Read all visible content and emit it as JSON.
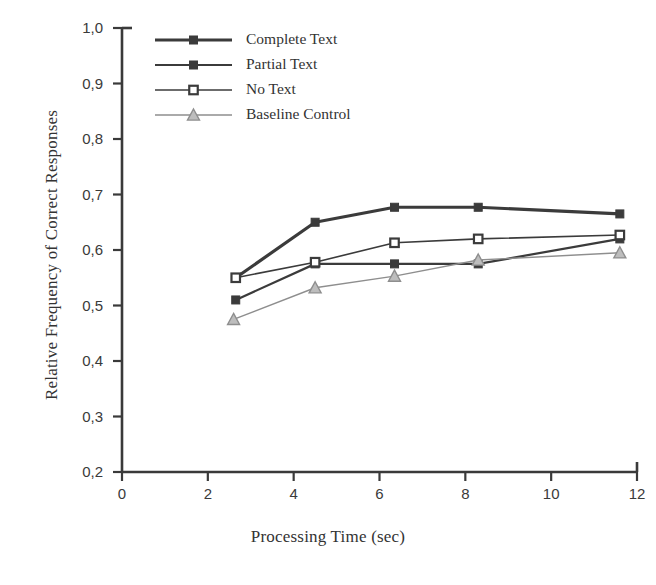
{
  "chart_data": {
    "type": "line",
    "title": "",
    "xlabel": "Processing Time (sec)",
    "ylabel": "Relative Frequency of Correct Responses",
    "xlim": [
      0,
      12
    ],
    "ylim": [
      0.2,
      1.0
    ],
    "xticks": [
      0,
      2,
      4,
      6,
      8,
      10,
      12
    ],
    "xtick_labels": [
      "0",
      "2",
      "4",
      "6",
      "8",
      "10",
      "12"
    ],
    "yticks": [
      0.2,
      0.3,
      0.4,
      0.5,
      0.6,
      0.7,
      0.8,
      0.9,
      1.0
    ],
    "ytick_labels": [
      "0,2",
      "0,3",
      "0,4",
      "0,5",
      "0,6",
      "0,7",
      "0,8",
      "0,9",
      "1,0"
    ],
    "grid": false,
    "legend_position": "upper-left-inside",
    "series": [
      {
        "name": "Complete Text",
        "marker": "filled-square",
        "color": "#3b3b3b",
        "line_width": 3.2,
        "x": [
          2.65,
          4.5,
          6.35,
          8.3,
          11.6
        ],
        "y": [
          0.55,
          0.65,
          0.677,
          0.677,
          0.665
        ]
      },
      {
        "name": "Partial Text",
        "marker": "filled-square",
        "color": "#3b3b3b",
        "line_width": 2.2,
        "x": [
          2.65,
          4.5,
          6.35,
          8.3,
          11.6
        ],
        "y": [
          0.51,
          0.575,
          0.575,
          0.575,
          0.62
        ]
      },
      {
        "name": "No Text",
        "marker": "open-square",
        "color": "#3b3b3b",
        "line_width": 1.6,
        "x": [
          2.65,
          4.5,
          6.35,
          8.3,
          11.6
        ],
        "y": [
          0.55,
          0.578,
          0.613,
          0.62,
          0.627
        ]
      },
      {
        "name": "Baseline Control",
        "marker": "triangle",
        "color": "#8e8e8e",
        "line_width": 1.4,
        "x": [
          2.6,
          4.5,
          6.35,
          8.3,
          11.6
        ],
        "y": [
          0.475,
          0.532,
          0.553,
          0.582,
          0.595
        ]
      }
    ]
  },
  "axes": {
    "y_axis_label": "Relative Frequency of Correct Responses",
    "x_axis_label": "Processing Time (sec)"
  },
  "legend": {
    "entries": [
      {
        "label": "Complete Text"
      },
      {
        "label": "Partial Text"
      },
      {
        "label": "No Text"
      },
      {
        "label": "Baseline Control"
      }
    ]
  }
}
